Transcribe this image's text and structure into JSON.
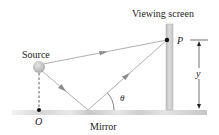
{
  "diagram": {
    "labels": {
      "source": "Source",
      "screen": "Viewing screen",
      "point": "P",
      "origin": "O",
      "mirror": "Mirror",
      "angle": "θ",
      "distance": "y"
    },
    "colors": {
      "ray": "#9a9a9a",
      "arrow": "#8c8c8c",
      "mirror": "#cfcfcf",
      "screen": "#c8c8c8",
      "source": "#b9b9b9",
      "text": "#222222"
    }
  }
}
